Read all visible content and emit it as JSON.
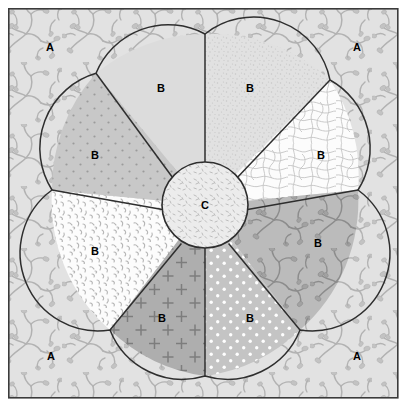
{
  "figure": {
    "frame": {
      "x": 8,
      "y": 8,
      "width": 390,
      "height": 390,
      "border_color": "#3b3b3b",
      "border_width": 1.6
    },
    "background": {
      "name": "matrix-background",
      "label": "A",
      "fill": "#e2e2e2",
      "pattern": "dendritic-branching",
      "pattern_color": "#b0b0b0",
      "labels": [
        {
          "text": "A",
          "x": 50,
          "y": 47
        },
        {
          "text": "A",
          "x": 357,
          "y": 47
        },
        {
          "text": "A",
          "x": 51,
          "y": 356
        },
        {
          "text": "A",
          "x": 357,
          "y": 356
        }
      ]
    },
    "rosette": {
      "center_x": 205,
      "center_y": 205,
      "outer_radius": 168,
      "notch_radius": 170,
      "petal_count": 7,
      "outline_color": "#2e2e2e",
      "outline_width": 1.5,
      "core": {
        "name": "core-circle",
        "label": "C",
        "radius": 43,
        "fill": "#ececec",
        "pattern": "fine-dash-speckle",
        "pattern_color": "#b9b9b9",
        "label_x": 205,
        "label_y": 205
      },
      "petals": [
        {
          "id": "petal-top-left",
          "label": "B",
          "fill": "#dcdcdc",
          "pattern": "plain",
          "pattern_color": "#c9c9c9",
          "label_x": 161,
          "label_y": 88
        },
        {
          "id": "petal-top-right",
          "label": "B",
          "fill": "#e0e0e0",
          "pattern": "fine-stipple",
          "pattern_color": "#c2c2c2",
          "label_x": 250,
          "label_y": 88
        },
        {
          "id": "petal-right",
          "label": "B",
          "fill": "#fbfbfb",
          "pattern": "contour-waves",
          "pattern_color": "#c6c6c6",
          "label_x": 321,
          "label_y": 155
        },
        {
          "id": "petal-lower-right",
          "label": "B",
          "fill": "#b9b9b9",
          "pattern": "dendritic-branching",
          "pattern_color": "#8d8d8d",
          "label_x": 318,
          "label_y": 243
        },
        {
          "id": "petal-bottom-right",
          "label": "B",
          "fill": "#c4c4c4",
          "pattern": "white-dots",
          "pattern_color": "#ffffff",
          "label_x": 250,
          "label_y": 318
        },
        {
          "id": "petal-bottom-left",
          "label": "B",
          "fill": "#aeaeae",
          "pattern": "plus-crosses",
          "pattern_color": "#7e7e7e",
          "label_x": 162,
          "label_y": 318
        },
        {
          "id": "petal-left",
          "label": "B",
          "fill": "#fbfbfb",
          "pattern": "short-dashes",
          "pattern_color": "#b6b6b6",
          "label_x": 95,
          "label_y": 251
        },
        {
          "id": "petal-upper-left",
          "label": "B",
          "fill": "#c8c8c8",
          "pattern": "dot-grid",
          "pattern_color": "#9a9a9a",
          "label_x": 95,
          "label_y": 155
        }
      ]
    },
    "legend_keys": {
      "matrix": "A",
      "petal": "B",
      "core": "C"
    }
  }
}
